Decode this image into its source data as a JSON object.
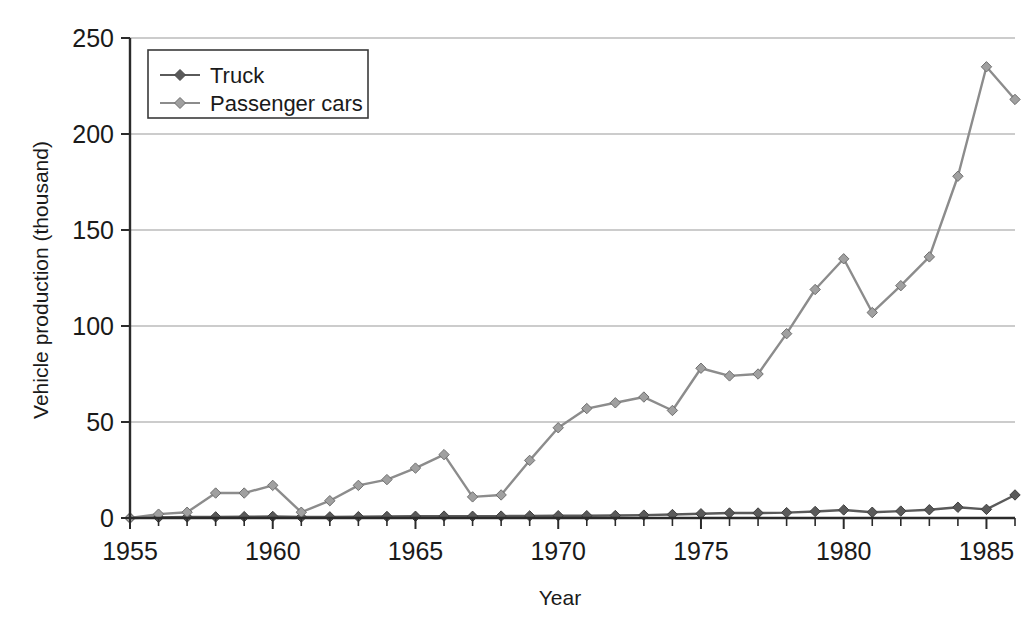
{
  "chart_data": {
    "type": "line",
    "title": "",
    "xlabel": "Year",
    "ylabel": "Vehicle production (thousand)",
    "xlim": [
      1955,
      1986
    ],
    "ylim": [
      0,
      250
    ],
    "yticks": [
      0,
      50,
      100,
      150,
      200,
      250
    ],
    "ytick_labels": [
      "0",
      "50",
      "100",
      "150",
      "200",
      "250"
    ],
    "xticks": [
      1955,
      1960,
      1965,
      1970,
      1975,
      1980,
      1985
    ],
    "xtick_labels": [
      "1955",
      "1960",
      "1965",
      "1970",
      "1975",
      "1980",
      "1985"
    ],
    "xtick_minor_step": 1,
    "grid": "horizontal",
    "legend_position": "top-left",
    "marker": "diamond",
    "x": [
      1955,
      1956,
      1957,
      1958,
      1959,
      1960,
      1961,
      1962,
      1963,
      1964,
      1965,
      1966,
      1967,
      1968,
      1969,
      1970,
      1971,
      1972,
      1973,
      1974,
      1975,
      1976,
      1977,
      1978,
      1979,
      1980,
      1981,
      1982,
      1983,
      1984,
      1985,
      1986
    ],
    "series": [
      {
        "name": "Truck",
        "color": "#5a5a5a",
        "values": [
          0,
          0.3,
          0.5,
          0.6,
          0.7,
          0.8,
          0.5,
          0.6,
          0.7,
          0.8,
          0.9,
          1.0,
          0.9,
          1.0,
          1.1,
          1.2,
          1.2,
          1.3,
          1.5,
          1.8,
          2.2,
          2.6,
          2.6,
          2.8,
          3.4,
          4.2,
          3.0,
          3.6,
          4.3,
          5.6,
          4.5,
          12.0
        ]
      },
      {
        "name": "Passenger cars",
        "color": "#8c8c8c",
        "values": [
          0,
          2,
          3,
          13,
          13,
          17,
          3,
          9,
          17,
          20,
          26,
          33,
          11,
          12,
          30,
          47,
          57,
          60,
          63,
          56,
          78,
          74,
          75,
          96,
          119,
          135,
          107,
          121,
          136,
          178,
          235,
          218
        ]
      }
    ]
  },
  "legend": {
    "entries": [
      {
        "label": "Truck"
      },
      {
        "label": "Passenger cars"
      }
    ]
  },
  "axes": {
    "y_title": "Vehicle production (thousand)",
    "x_title": "Year"
  },
  "colors": {
    "truck": "#5a5a5a",
    "passenger_cars": "#8c8c8c",
    "grid": "#9a9a9a",
    "axis": "#2b2b2b",
    "background": "#ffffff"
  }
}
